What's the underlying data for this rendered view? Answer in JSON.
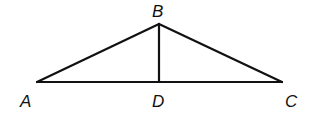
{
  "diagram": {
    "type": "triangle",
    "stroke_color": "#111111",
    "points": {
      "A": {
        "label": "A",
        "x": 37,
        "y": 82
      },
      "B": {
        "label": "B",
        "x": 159,
        "y": 24
      },
      "C": {
        "label": "C",
        "x": 282,
        "y": 82
      },
      "D": {
        "label": "D",
        "x": 159,
        "y": 82
      }
    },
    "segments": [
      "AB",
      "BC",
      "AC",
      "BD"
    ]
  }
}
